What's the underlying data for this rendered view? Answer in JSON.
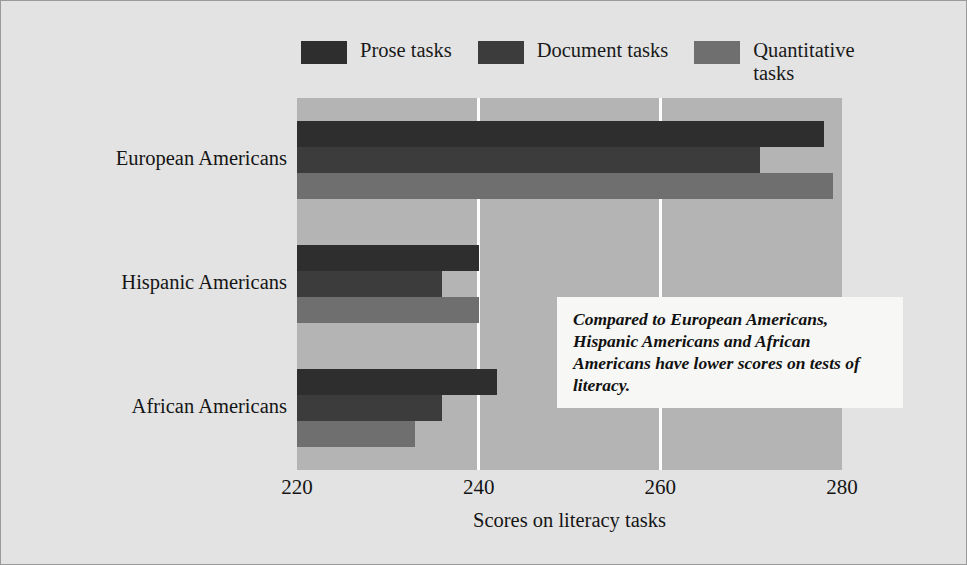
{
  "figure": {
    "background": "#e3e3e3",
    "plot_background": "#b4b4b4",
    "border_color": "#9a9a9a"
  },
  "annotation": {
    "text": "Compared to European Americans, Hispanic Americans and African Americans have lower scores on tests of literacy.",
    "background": "#f7f7f5"
  },
  "chart_data": {
    "type": "bar",
    "orientation": "horizontal",
    "title": "",
    "subtitle": "",
    "xlabel": "Scores on literacy tasks",
    "ylabel": "",
    "xlim": [
      220,
      280
    ],
    "xticks": [
      220,
      240,
      260,
      280
    ],
    "xtick_labels": [
      "220",
      "240",
      "260",
      "280"
    ],
    "grid": "vertical gridlines at 240 and 260, white",
    "legend_position": "top-center",
    "categories": [
      "European Americans",
      "Hispanic Americans",
      "African Americans"
    ],
    "series": [
      {
        "name": "Prose tasks",
        "color": "#2e2e2e",
        "values": [
          278,
          240,
          242
        ]
      },
      {
        "name": "Document tasks",
        "color": "#3c3c3c",
        "values": [
          271,
          236,
          236
        ]
      },
      {
        "name": "Quantitative tasks",
        "color": "#6f6f6f",
        "values": [
          279,
          240,
          233
        ]
      }
    ],
    "legend_labels": [
      "Prose tasks",
      "Document tasks",
      "Quantitative tasks"
    ]
  }
}
